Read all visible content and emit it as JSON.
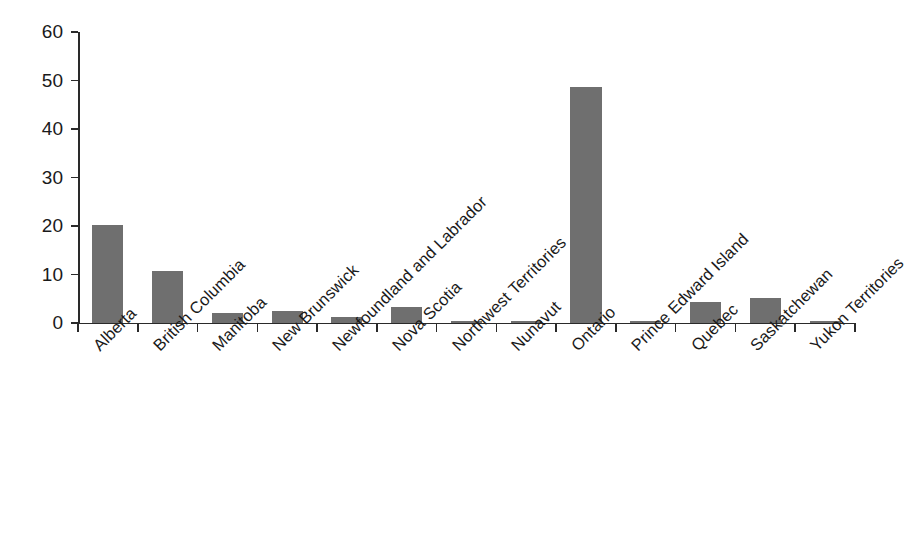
{
  "chart_data": {
    "type": "bar",
    "title": "",
    "subtitle": "",
    "xlabel": "",
    "ylabel": "",
    "ylim": [
      0,
      60
    ],
    "yticks": [
      0,
      10,
      20,
      30,
      40,
      50,
      60
    ],
    "ytick_labels": [
      "0",
      "10",
      "20",
      "30",
      "40",
      "50",
      "60"
    ],
    "grid": false,
    "legend": false,
    "legend_position": "none",
    "bar_color": "#6f6f6f",
    "axis_color": "#2a2a2a",
    "background_color": "#ffffff",
    "xtick_label_rotation": -45,
    "categories": [
      "Alberta",
      "British Columbia",
      "Manitoba",
      "New Brunswick",
      "Newfoundland and Labrador",
      "Nova Scotia",
      "Northwest Territories",
      "Nunavut",
      "Ontario",
      "Prince Edward Island",
      "Quebec",
      "Saskatchewan",
      "Yukon Territories"
    ],
    "values": [
      20.3,
      10.8,
      2.1,
      2.4,
      1.3,
      3.3,
      0.3,
      0.3,
      48.7,
      0.5,
      4.3,
      5.2,
      0.3
    ]
  }
}
